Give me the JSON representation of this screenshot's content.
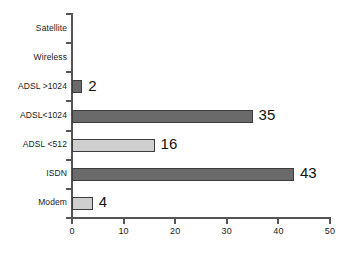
{
  "chart_data": {
    "type": "bar",
    "orientation": "horizontal",
    "title": "",
    "xlabel": "",
    "ylabel": "",
    "xlim": [
      0,
      50
    ],
    "xticks": [
      0,
      10,
      20,
      30,
      40,
      50
    ],
    "grid": false,
    "legend": null,
    "categories": [
      "Satellite",
      "Wireless",
      "ADSL >1024",
      "ADSL<1024",
      "ADSL <512",
      "ISDN",
      "Modem"
    ],
    "values": [
      0,
      0,
      2,
      35,
      16,
      43,
      4
    ],
    "value_labels": [
      "",
      "",
      "2",
      "35",
      "16",
      "43",
      "4"
    ],
    "bar_shades": [
      "light",
      "light",
      "dark",
      "dark",
      "light",
      "dark",
      "light"
    ],
    "colors": {
      "light_bar": "#cfcfcf",
      "dark_bar": "#6a6a6a",
      "bar_border": "#3d3d3d",
      "axis": "#555555",
      "text": "#1a1a1a",
      "background": "#ffffff"
    }
  }
}
